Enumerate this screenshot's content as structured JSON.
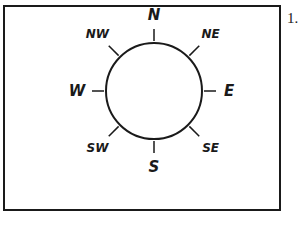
{
  "item_number": "1.",
  "compass": {
    "center": [
      154,
      91
    ],
    "radius": 48,
    "stroke_color": "#1a1a1a",
    "directions": [
      {
        "label": "N",
        "angle": 90,
        "tick_in": 50,
        "tick_out": 62,
        "label_r": 76,
        "size": 15
      },
      {
        "label": "NE",
        "angle": 45,
        "tick_in": 50,
        "tick_out": 64,
        "label_r": 80,
        "size": 12
      },
      {
        "label": "E",
        "angle": 0,
        "tick_in": 50,
        "tick_out": 62,
        "label_r": 75,
        "size": 15
      },
      {
        "label": "SE",
        "angle": -45,
        "tick_in": 50,
        "tick_out": 64,
        "label_r": 80,
        "size": 12
      },
      {
        "label": "S",
        "angle": -90,
        "tick_in": 50,
        "tick_out": 62,
        "label_r": 76,
        "size": 15
      },
      {
        "label": "SW",
        "angle": -135,
        "tick_in": 50,
        "tick_out": 64,
        "label_r": 80,
        "size": 12
      },
      {
        "label": "W",
        "angle": 180,
        "tick_in": 50,
        "tick_out": 62,
        "label_r": 77,
        "size": 15
      },
      {
        "label": "NW",
        "angle": 135,
        "tick_in": 50,
        "tick_out": 64,
        "label_r": 80,
        "size": 12
      }
    ]
  }
}
